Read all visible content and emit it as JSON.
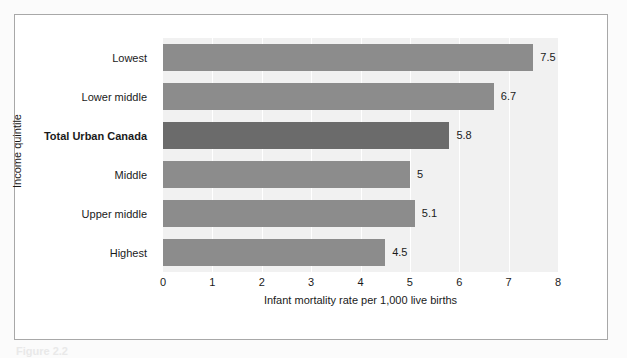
{
  "figure": {
    "caption": "Figure 2.2",
    "background_color": "#fbfbfb",
    "frame_color": "#a8a8a8"
  },
  "chart_data": {
    "type": "bar",
    "orientation": "horizontal",
    "title": "",
    "xlabel": "Infant mortality rate per 1,000 live births",
    "ylabel": "Income quintile",
    "xlim": [
      0,
      8
    ],
    "xticks": [
      0,
      1,
      2,
      3,
      4,
      5,
      6,
      7,
      8
    ],
    "xtick_labels": [
      "0",
      "1",
      "2",
      "3",
      "4",
      "5",
      "6",
      "7",
      "8"
    ],
    "grid": "vertical-white",
    "legend": "none",
    "plot_background": "#f1f1f1",
    "bar_color": "#8c8c8c",
    "highlight_bar_color": "#6b6b6b",
    "categories": [
      "Lowest",
      "Lower middle",
      "Total Urban Canada",
      "Middle",
      "Upper middle",
      "Highest"
    ],
    "values": [
      7.5,
      6.7,
      5.8,
      5,
      5.1,
      4.5
    ],
    "value_labels": [
      "7.5",
      "6.7",
      "5.8",
      "5",
      "5.1",
      "4.5"
    ],
    "highlighted": [
      false,
      false,
      true,
      false,
      false,
      false
    ]
  }
}
